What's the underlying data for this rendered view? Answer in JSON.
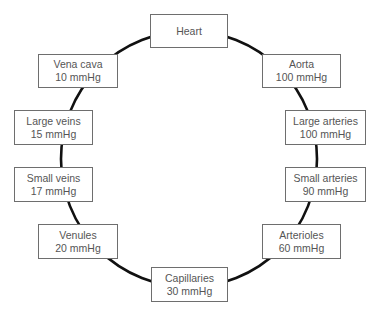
{
  "diagram": {
    "type": "circulatory-pressure-cycle",
    "line_color": "#111111",
    "box_border_color": "#6e6e6e",
    "text_color": "#555555",
    "nodes": [
      {
        "id": "heart",
        "name": "Heart",
        "pressure": "",
        "x": 150,
        "y": 14,
        "w": 78,
        "h": 34
      },
      {
        "id": "aorta",
        "name": "Aorta",
        "pressure": "100 mmHg",
        "x": 262,
        "y": 54,
        "w": 79,
        "h": 34
      },
      {
        "id": "large-arteries",
        "name": "Large arteries",
        "pressure": "100 mmHg",
        "x": 285,
        "y": 110,
        "w": 81,
        "h": 35
      },
      {
        "id": "small-arteries",
        "name": "Small arteries",
        "pressure": "90 mmHg",
        "x": 285,
        "y": 167,
        "w": 81,
        "h": 35
      },
      {
        "id": "arterioles",
        "name": "Arterioles",
        "pressure": "60 mmHg",
        "x": 262,
        "y": 224,
        "w": 79,
        "h": 35
      },
      {
        "id": "capillaries",
        "name": "Capillaries",
        "pressure": "30 mmHg",
        "x": 151,
        "y": 267,
        "w": 77,
        "h": 35
      },
      {
        "id": "venules",
        "name": "Venules",
        "pressure": "20 mmHg",
        "x": 38,
        "y": 224,
        "w": 80,
        "h": 35
      },
      {
        "id": "small-veins",
        "name": "Small veins",
        "pressure": "17 mmHg",
        "x": 14,
        "y": 167,
        "w": 79,
        "h": 35
      },
      {
        "id": "large-veins",
        "name": "Large veins",
        "pressure": "15 mmHg",
        "x": 14,
        "y": 110,
        "w": 79,
        "h": 35
      },
      {
        "id": "vena-cava",
        "name": "Vena cava",
        "pressure": "10 mmHg",
        "x": 38,
        "y": 54,
        "w": 80,
        "h": 34
      }
    ],
    "circle": {
      "cx": 189,
      "cy": 159,
      "r": 128
    }
  }
}
